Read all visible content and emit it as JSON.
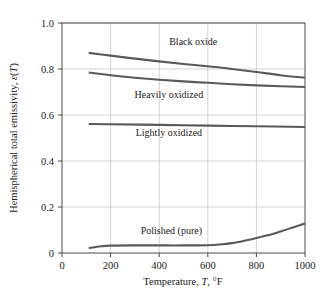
{
  "chart_data": {
    "type": "line",
    "title": "",
    "xlabel": "Temperature, T, °F",
    "ylabel": "Hemispherical total emissivity, ε(T)",
    "xlim": [
      0,
      1000
    ],
    "ylim": [
      0,
      1.0
    ],
    "grid": true,
    "legend_position": "inline-labels",
    "x_ticks": [
      0,
      200,
      400,
      600,
      800,
      1000
    ],
    "x_tick_labels": [
      "0",
      "200",
      "400",
      "600",
      "800",
      "1000"
    ],
    "y_ticks": [
      0,
      0.2,
      0.4,
      0.6,
      0.8,
      1.0
    ],
    "y_tick_labels": [
      "0",
      "0.2",
      "0.4",
      "0.6",
      "0.8",
      "1.0"
    ],
    "line_color": "#595959",
    "grid_color": "#c8c8c8",
    "axis_color": "#4a4a4a",
    "series": [
      {
        "name": "Black oxide",
        "label": "Black oxide",
        "label_x": 540,
        "label_y": 0.905,
        "x": [
          110,
          200,
          300,
          400,
          500,
          600,
          700,
          800,
          900,
          1000
        ],
        "values": [
          0.87,
          0.858,
          0.845,
          0.833,
          0.822,
          0.812,
          0.8,
          0.787,
          0.773,
          0.762
        ]
      },
      {
        "name": "Heavily oxidized",
        "label": "Heavily oxidized",
        "label_x": 440,
        "label_y": 0.675,
        "x": [
          110,
          200,
          300,
          400,
          500,
          600,
          700,
          800,
          900,
          1000
        ],
        "values": [
          0.785,
          0.773,
          0.762,
          0.753,
          0.746,
          0.74,
          0.734,
          0.729,
          0.725,
          0.722
        ]
      },
      {
        "name": "Lightly oxidized",
        "label": "Lightly oxidized",
        "label_x": 440,
        "label_y": 0.508,
        "x": [
          110,
          200,
          400,
          600,
          800,
          1000
        ],
        "values": [
          0.561,
          0.56,
          0.557,
          0.554,
          0.551,
          0.548
        ]
      },
      {
        "name": "Polished (pure)",
        "label": "Polished (pure)",
        "label_x": 450,
        "label_y": 0.082,
        "x": [
          110,
          160,
          200,
          300,
          400,
          500,
          600,
          650,
          700,
          750,
          800,
          850,
          900,
          950,
          1000
        ],
        "values": [
          0.021,
          0.029,
          0.032,
          0.033,
          0.033,
          0.033,
          0.034,
          0.037,
          0.043,
          0.053,
          0.065,
          0.078,
          0.094,
          0.111,
          0.128
        ]
      }
    ]
  },
  "axes": {
    "x_title_prefix": "Temperature, ",
    "x_title_italic": "T",
    "x_title_suffix": ", °F",
    "y_title_prefix": "Hemispherical total emissivity, ",
    "y_title_italic_eps": "ε",
    "y_title_open_paren": "(",
    "y_title_italic_t": "T",
    "y_title_close_paren": ")"
  }
}
